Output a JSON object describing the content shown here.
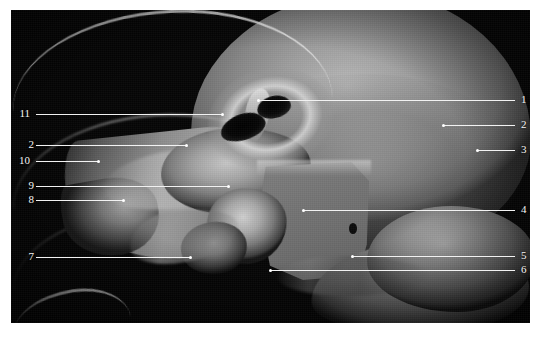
{
  "figure": {
    "kind": "anatomical-specimen-photograph",
    "background_color": "#ffffff",
    "plate_color": "#050505",
    "leader_color": "#f2f2f2",
    "label_color": "#f5f5f5"
  },
  "caption": {
    "text": "",
    "visible": false
  },
  "labels_left": [
    {
      "id": "11",
      "number": "11",
      "num_x": 14,
      "num_y": 108,
      "line_x1": 36,
      "line_x2": 222,
      "line_y": 114
    },
    {
      "id": "2L",
      "number": "2",
      "num_x": 18,
      "num_y": 139,
      "line_x1": 36,
      "line_x2": 186,
      "line_y": 145
    },
    {
      "id": "10",
      "number": "10",
      "num_x": 14,
      "num_y": 155,
      "line_x1": 36,
      "line_x2": 98,
      "line_y": 161
    },
    {
      "id": "9",
      "number": "9",
      "num_x": 18,
      "num_y": 180,
      "line_x1": 36,
      "line_x2": 228,
      "line_y": 186
    },
    {
      "id": "8",
      "number": "8",
      "num_x": 18,
      "num_y": 194,
      "line_x1": 36,
      "line_x2": 123,
      "line_y": 200
    },
    {
      "id": "7",
      "number": "7",
      "num_x": 18,
      "num_y": 251,
      "line_x1": 36,
      "line_x2": 190,
      "line_y": 257
    }
  ],
  "labels_right": [
    {
      "id": "1",
      "number": "1",
      "num_x": 521,
      "num_y": 94,
      "line_x1": 258,
      "line_x2": 515,
      "line_y": 100
    },
    {
      "id": "2",
      "number": "2",
      "num_x": 521,
      "num_y": 119,
      "line_x1": 443,
      "line_x2": 515,
      "line_y": 125
    },
    {
      "id": "3",
      "number": "3",
      "num_x": 521,
      "num_y": 144,
      "line_x1": 477,
      "line_x2": 515,
      "line_y": 150
    },
    {
      "id": "4",
      "number": "4",
      "num_x": 521,
      "num_y": 204,
      "line_x1": 303,
      "line_x2": 515,
      "line_y": 210
    },
    {
      "id": "5",
      "number": "5",
      "num_x": 521,
      "num_y": 250,
      "line_x1": 352,
      "line_x2": 515,
      "line_y": 256
    },
    {
      "id": "6",
      "number": "6",
      "num_x": 521,
      "num_y": 264,
      "line_x1": 270,
      "line_x2": 515,
      "line_y": 270
    }
  ],
  "plate": {
    "x": 11,
    "y": 10,
    "width": 519,
    "height": 313
  }
}
